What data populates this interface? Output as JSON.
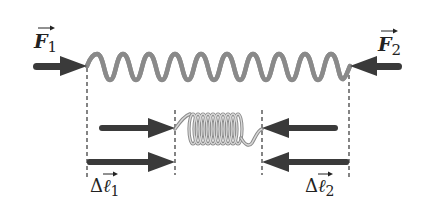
{
  "diagram": {
    "type": "physics-spring-compression",
    "colors": {
      "arrow": "#3a3a3a",
      "spring_light": "#d4d4d4",
      "spring_dark": "#8c8c8c",
      "dashed_line": "#333333",
      "text": "#222222"
    },
    "labels": {
      "force_left": {
        "symbol": "F",
        "subscript": "1"
      },
      "force_right": {
        "symbol": "F",
        "subscript": "2"
      },
      "displacement_left": {
        "prefix": "Δ",
        "symbol": "ℓ",
        "subscript": "1"
      },
      "displacement_right": {
        "prefix": "Δ",
        "symbol": "ℓ",
        "subscript": "2"
      }
    },
    "elements": [
      {
        "name": "relaxed-spring",
        "x_start": 87,
        "x_end": 350,
        "y": 66,
        "coils": 11
      },
      {
        "name": "compressed-spring",
        "x_start": 175,
        "x_end": 262,
        "y": 129,
        "coils": 10
      },
      {
        "name": "force-arrow-F1",
        "direction": "right",
        "x_start": 33,
        "x_end": 87,
        "y": 66
      },
      {
        "name": "force-arrow-F2",
        "direction": "left",
        "x_start": 402,
        "x_end": 350,
        "y": 66
      },
      {
        "name": "force-arrow-middle-left",
        "direction": "right",
        "x_start": 99,
        "x_end": 175,
        "y": 128
      },
      {
        "name": "force-arrow-middle-right",
        "direction": "left",
        "x_start": 338,
        "x_end": 262,
        "y": 128
      },
      {
        "name": "displacement-arrow-1",
        "direction": "right",
        "x_start": 87,
        "x_end": 175,
        "y": 162
      },
      {
        "name": "displacement-arrow-2",
        "direction": "left",
        "x_start": 349,
        "x_end": 262,
        "y": 162
      }
    ]
  }
}
